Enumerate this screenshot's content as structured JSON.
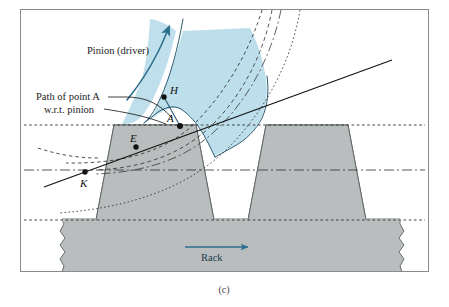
{
  "figure": {
    "caption": "(c)",
    "border_color": "#8a8a8a",
    "background": "#ffffff"
  },
  "labels": {
    "pinion": "Pinion (driver)",
    "path_line1": "Path of point A",
    "path_line2": "w.r.t. pinion",
    "rack": "Rack",
    "point_h": "H",
    "point_a": "A",
    "point_e": "E",
    "point_k": "K"
  },
  "colors": {
    "pinion_fill": "#b9dcea",
    "pinion_stroke": "#2d5c70",
    "rack_fill": "#b9bdbd",
    "rack_stroke": "#5a6060",
    "arrow_blue": "#2e6f8e",
    "line_black": "#111111",
    "dotted_gray": "#3a3a3a",
    "border": "#8a8a8a"
  },
  "geometry": {
    "addendum_line_y": 125,
    "pitch_line_y": 170,
    "root_line_y": 220,
    "rack_body_bottom_y": 278,
    "point_h": [
      164,
      97
    ],
    "point_a": [
      180,
      126
    ],
    "point_e": [
      136,
      147
    ],
    "point_k": [
      85,
      172
    ]
  }
}
